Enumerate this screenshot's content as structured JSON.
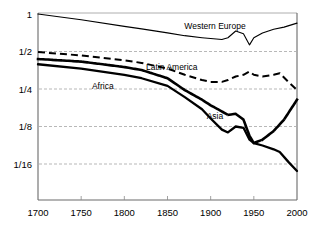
{
  "chart_data": {
    "type": "line",
    "title": "",
    "xlabel": "",
    "ylabel": "",
    "yscale": "log2",
    "ylim": [
      0.042,
      1.12
    ],
    "xlim": [
      1700,
      2000
    ],
    "grid": true,
    "gridlines_y": [
      0.5,
      0.25,
      0.125,
      0.0625
    ],
    "legend_position": "inline-annotations",
    "xticks": [
      1700,
      1750,
      1800,
      1850,
      1900,
      1950,
      2000
    ],
    "xtick_labels": [
      "1700",
      "1750",
      "1800",
      "1850",
      "1900",
      "1950",
      "2000"
    ],
    "yticks": [
      1,
      0.5,
      0.25,
      0.125,
      0.0625
    ],
    "ytick_labels": [
      "1",
      "1/2",
      "1/4",
      "1/8",
      "1/16"
    ],
    "series": [
      {
        "name": "Western Europe",
        "style": "solid-thin",
        "label_x": 1905,
        "label_y": 0.8,
        "x": [
          1700,
          1750,
          1800,
          1820,
          1850,
          1870,
          1890,
          1900,
          1913,
          1920,
          1929,
          1938,
          1945,
          1950,
          1960,
          1973,
          1985,
          2000
        ],
        "values": [
          1.0,
          0.9,
          0.795,
          0.76,
          0.705,
          0.67,
          0.645,
          0.635,
          0.625,
          0.645,
          0.73,
          0.695,
          0.565,
          0.645,
          0.705,
          0.755,
          0.785,
          0.845
        ]
      },
      {
        "name": "Latin America",
        "style": "dashed",
        "label_x": 1855,
        "label_y": 0.375,
        "x": [
          1700,
          1750,
          1800,
          1820,
          1850,
          1870,
          1890,
          1900,
          1913,
          1920,
          1929,
          1938,
          1945,
          1950,
          1960,
          1973,
          1980,
          1990,
          2000
        ],
        "values": [
          0.495,
          0.465,
          0.425,
          0.405,
          0.365,
          0.325,
          0.295,
          0.285,
          0.285,
          0.295,
          0.315,
          0.325,
          0.345,
          0.325,
          0.315,
          0.325,
          0.335,
          0.285,
          0.245
        ]
      },
      {
        "name": "Asia",
        "style": "dotted",
        "label_x": 1905,
        "label_y": 0.152,
        "x": [
          1700,
          1750,
          1800,
          1820,
          1850,
          1870,
          1890,
          1900,
          1913,
          1920,
          1929,
          1938,
          1945,
          1950,
          1960,
          1973,
          1985,
          2000
        ],
        "values": [
          0.435,
          0.415,
          0.375,
          0.355,
          0.305,
          0.245,
          0.205,
          0.185,
          0.165,
          0.155,
          0.158,
          0.142,
          0.105,
          0.092,
          0.098,
          0.115,
          0.142,
          0.205
        ]
      },
      {
        "name": "Africa",
        "style": "solid-thick",
        "label_x": 1775,
        "label_y": 0.265,
        "x": [
          1700,
          1750,
          1800,
          1820,
          1850,
          1870,
          1890,
          1900,
          1913,
          1920,
          1929,
          1938,
          1945,
          1950,
          1960,
          1973,
          1980,
          1990,
          2000
        ],
        "values": [
          0.395,
          0.365,
          0.325,
          0.305,
          0.265,
          0.215,
          0.172,
          0.145,
          0.118,
          0.112,
          0.125,
          0.122,
          0.098,
          0.092,
          0.088,
          0.082,
          0.078,
          0.065,
          0.055
        ]
      }
    ]
  }
}
